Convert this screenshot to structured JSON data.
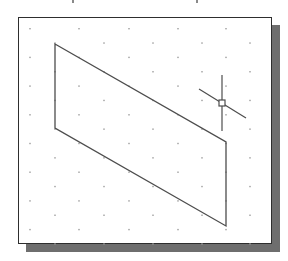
{
  "drawing": {
    "viewport": {
      "frame": {
        "x": 18,
        "y": 17,
        "width": 254,
        "height": 227,
        "border_color": "#2e2e2e",
        "fill": "#ffffff"
      },
      "shadow": {
        "offset_x": 8,
        "offset_y": 8,
        "color": "#6e6e6e"
      }
    },
    "grid": {
      "type": "isometric-dot-grid",
      "dot_color": "#9a9a9a",
      "row_spacing": 14.35,
      "col_spacing": 48.7,
      "first_row_y": 28.7,
      "row_a_xs": [
        30,
        79,
        129,
        178,
        226
      ],
      "row_b_xs": [
        55,
        104,
        153,
        202,
        250
      ],
      "row_count": 16
    },
    "parallelogram": {
      "stroke": "#4d4d4d",
      "points": [
        [
          55,
          44
        ],
        [
          226,
          142
        ],
        [
          226,
          226
        ],
        [
          55,
          128
        ]
      ]
    },
    "cursor": {
      "type": "crosshair-with-pickbox",
      "stroke": "#4d4d4d",
      "center": [
        222,
        103
      ],
      "vertical": {
        "y1": 75,
        "y2": 131
      },
      "diagonal": {
        "x1": 199,
        "y1": 89,
        "x2": 246,
        "y2": 118
      },
      "pickbox_size": 6
    },
    "cut_text_marks": [
      72,
      196
    ]
  }
}
